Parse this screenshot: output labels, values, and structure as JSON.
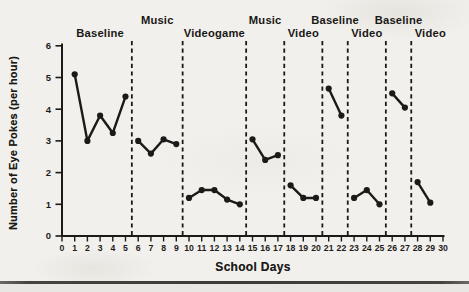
{
  "chart_data": {
    "type": "line",
    "title": "",
    "xlabel": "School Days",
    "ylabel": "Number of Eye Pokes (per hour)",
    "xlim": [
      0,
      30
    ],
    "ylim": [
      0,
      6
    ],
    "x_ticks": [
      0,
      1,
      2,
      3,
      4,
      5,
      6,
      7,
      8,
      9,
      10,
      11,
      12,
      13,
      14,
      15,
      16,
      17,
      18,
      19,
      20,
      21,
      22,
      23,
      24,
      25,
      26,
      27,
      28,
      29,
      30
    ],
    "y_ticks": [
      0,
      1,
      2,
      3,
      4,
      5,
      6
    ],
    "grid": false,
    "legend": "none",
    "line_color": "#1b1a18",
    "background_color": "#f2f0ec",
    "phase_boundaries_day": [
      5.5,
      9.5,
      14.5,
      17.5,
      20.5,
      22.5,
      25.5,
      27.5
    ],
    "series": [
      {
        "name": "Baseline",
        "label_row": 2,
        "label_center_day": 3,
        "x": [
          1,
          2,
          3,
          4,
          5
        ],
        "y": [
          5.1,
          3.0,
          3.8,
          3.25,
          4.4
        ]
      },
      {
        "name": "Music",
        "label_row": 1,
        "label_center_day": 7.5,
        "x": [
          6,
          7,
          8,
          9
        ],
        "y": [
          3.0,
          2.6,
          3.05,
          2.9
        ]
      },
      {
        "name": "Videogame",
        "label_row": 2,
        "label_center_day": 12,
        "x": [
          10,
          11,
          12,
          13,
          14
        ],
        "y": [
          1.2,
          1.45,
          1.45,
          1.15,
          1.0
        ]
      },
      {
        "name": "Music",
        "label_row": 1,
        "label_center_day": 16,
        "x": [
          15,
          16,
          17
        ],
        "y": [
          3.05,
          2.4,
          2.55
        ]
      },
      {
        "name": "Video",
        "label_row": 2,
        "label_center_day": 19,
        "x": [
          18,
          19,
          20
        ],
        "y": [
          1.6,
          1.2,
          1.2
        ]
      },
      {
        "name": "Baseline",
        "label_row": 1,
        "label_center_day": 21.5,
        "x": [
          21,
          22
        ],
        "y": [
          4.65,
          3.8
        ]
      },
      {
        "name": "Video",
        "label_row": 2,
        "label_center_day": 24,
        "x": [
          23,
          24,
          25
        ],
        "y": [
          1.2,
          1.45,
          1.0
        ]
      },
      {
        "name": "Baseline",
        "label_row": 1,
        "label_center_day": 26.5,
        "x": [
          26,
          27
        ],
        "y": [
          4.5,
          4.05
        ]
      },
      {
        "name": "Video",
        "label_row": 2,
        "label_center_day": 29,
        "x": [
          28,
          29
        ],
        "y": [
          1.7,
          1.05
        ]
      }
    ]
  }
}
